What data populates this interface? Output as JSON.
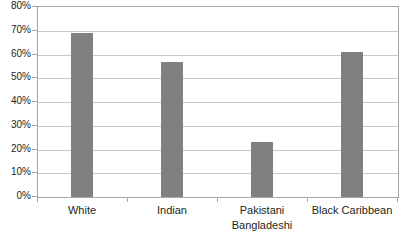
{
  "chart_data": {
    "type": "bar",
    "title": "",
    "subtitle": "",
    "xlabel": "",
    "ylabel": "",
    "categories": [
      "White",
      "Indian",
      "Pakistani Bangladeshi",
      "Black Caribbean"
    ],
    "category_lines": [
      [
        "White"
      ],
      [
        "Indian"
      ],
      [
        "Pakistani",
        "Bangladeshi"
      ],
      [
        "Black Caribbean"
      ]
    ],
    "values": [
      69,
      57,
      23,
      61
    ],
    "value_labels": [
      "69%",
      "57%",
      "23%",
      "61%"
    ],
    "ylim": [
      0,
      80
    ],
    "ytick_values": [
      0,
      10,
      20,
      30,
      40,
      50,
      60,
      70,
      80
    ],
    "ytick_labels": [
      "0%",
      "10%",
      "20%",
      "30%",
      "40%",
      "50%",
      "60%",
      "70%",
      "80%"
    ],
    "grid": true,
    "legend": false,
    "legend_position": "none",
    "series": [
      {
        "name": "",
        "values": [
          69,
          57,
          23,
          61
        ]
      }
    ]
  },
  "style": {
    "bar_color": "#808080",
    "gridline_color": "#c9c9c9",
    "axis_color": "#a6a6a6",
    "text_color": "#231f20",
    "background": "#ffffff"
  }
}
